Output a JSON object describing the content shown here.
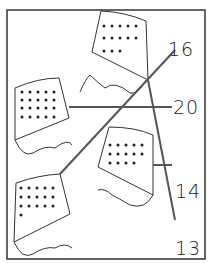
{
  "figure": {
    "kites": [
      {
        "id": "kite-top",
        "dots": 13,
        "rows": [
          5,
          5,
          3
        ]
      },
      {
        "id": "kite-left",
        "dots": 20,
        "rows": [
          5,
          5,
          5,
          5
        ]
      },
      {
        "id": "kite-right",
        "dots": 14,
        "rows": [
          5,
          5,
          4
        ]
      },
      {
        "id": "kite-bottom",
        "dots": 16,
        "rows": [
          5,
          5,
          5,
          1
        ]
      }
    ],
    "labels": [
      {
        "text": "16",
        "x": 168,
        "y": 38
      },
      {
        "text": "20",
        "x": 173,
        "y": 96
      },
      {
        "text": "14",
        "x": 175,
        "y": 180
      },
      {
        "text": "13",
        "x": 175,
        "y": 237
      }
    ]
  }
}
